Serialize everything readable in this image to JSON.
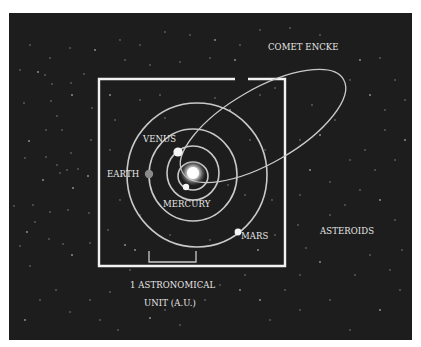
{
  "colors": {
    "page_bg": "#ffffff",
    "space_bg": "#1d1d1d",
    "orbit": "#c9c9c9",
    "box": "#f2f2f2",
    "label": "#e8e8e8",
    "star": "#9a9a9a",
    "earth": "#8a8a8a",
    "planet": "#f5f5f5"
  },
  "panel": {
    "x": 9,
    "y": 13,
    "w": 403,
    "h": 327
  },
  "scale_box": {
    "x": 99,
    "y": 79,
    "w": 186,
    "h": 187,
    "gap_x1": 235,
    "gap_x2": 248
  },
  "scale_bar": {
    "x1": 149,
    "x2": 196,
    "y_top": 251,
    "y_bottom": 262
  },
  "sun": {
    "cx": 193,
    "cy": 173,
    "core_r": 6,
    "glow_r": 13
  },
  "orbits": [
    {
      "name": "mercury-orbit",
      "cx": 193,
      "cy": 176,
      "rx": 15,
      "ry": 14
    },
    {
      "name": "venus-orbit",
      "cx": 193,
      "cy": 173,
      "rx": 26,
      "ry": 27
    },
    {
      "name": "earth-orbit",
      "cx": 193,
      "cy": 175,
      "rx": 44,
      "ry": 46
    },
    {
      "name": "mars-orbit",
      "cx": 197,
      "cy": 175,
      "rx": 70,
      "ry": 72
    }
  ],
  "comet_orbit": {
    "cx": 263,
    "cy": 126,
    "rx": 93,
    "ry": 37,
    "rotate": -30
  },
  "planets": [
    {
      "name": "mercury",
      "cx": 186,
      "cy": 187,
      "r": 3.2,
      "fill": "#f5f5f5"
    },
    {
      "name": "venus",
      "cx": 178,
      "cy": 152,
      "r": 4.6,
      "fill": "#f5f5f5"
    },
    {
      "name": "earth",
      "cx": 149,
      "cy": 174,
      "r": 4.2,
      "fill": "#8a8a8a"
    },
    {
      "name": "mars",
      "cx": 238,
      "cy": 232,
      "r": 3.4,
      "fill": "#f5f5f5"
    }
  ],
  "labels": {
    "comet": {
      "text": "COMET ENCKE",
      "x": 268,
      "y": 50
    },
    "venus": {
      "text": "VENUS",
      "x": 143,
      "y": 142
    },
    "earth": {
      "text": "EARTH",
      "x": 107,
      "y": 177
    },
    "mercury": {
      "text": "MERCURY",
      "x": 163,
      "y": 207
    },
    "mars": {
      "text": "MARS",
      "x": 241,
      "y": 239
    },
    "asteroids": {
      "text": "ASTEROIDS",
      "x": 320,
      "y": 234
    },
    "au_line1": {
      "text": "1 ASTRONOMICAL",
      "x": 130,
      "y": 288
    },
    "au_line2": {
      "text": "UNIT (A.U.)",
      "x": 144,
      "y": 306
    }
  },
  "stars": [
    [
      38,
      72
    ],
    [
      45,
      75
    ],
    [
      52,
      84
    ],
    [
      24,
      103
    ],
    [
      51,
      101
    ],
    [
      72,
      95
    ],
    [
      71,
      83
    ],
    [
      57,
      116
    ],
    [
      46,
      130
    ],
    [
      62,
      130
    ],
    [
      29,
      141
    ],
    [
      46,
      157
    ],
    [
      25,
      158
    ],
    [
      71,
      153
    ],
    [
      67,
      170
    ],
    [
      43,
      180
    ],
    [
      60,
      173
    ],
    [
      57,
      165
    ],
    [
      78,
      169
    ],
    [
      33,
      205
    ],
    [
      73,
      188
    ],
    [
      68,
      210
    ],
    [
      50,
      212
    ],
    [
      35,
      222
    ],
    [
      89,
      213
    ],
    [
      88,
      176
    ],
    [
      91,
      140
    ],
    [
      92,
      108
    ],
    [
      84,
      74
    ],
    [
      14,
      206
    ],
    [
      27,
      232
    ],
    [
      20,
      246
    ],
    [
      49,
      239
    ],
    [
      63,
      244
    ],
    [
      90,
      243
    ],
    [
      72,
      255
    ],
    [
      30,
      266
    ],
    [
      56,
      290
    ],
    [
      40,
      300
    ],
    [
      70,
      312
    ],
    [
      25,
      320
    ],
    [
      90,
      300
    ],
    [
      110,
      292
    ],
    [
      100,
      320
    ],
    [
      118,
      330
    ],
    [
      150,
      318
    ],
    [
      180,
      325
    ],
    [
      205,
      300
    ],
    [
      220,
      285
    ],
    [
      245,
      275
    ],
    [
      260,
      300
    ],
    [
      270,
      320
    ],
    [
      300,
      310
    ],
    [
      330,
      300
    ],
    [
      350,
      330
    ],
    [
      380,
      310
    ],
    [
      400,
      290
    ],
    [
      390,
      270
    ],
    [
      370,
      255
    ],
    [
      355,
      275
    ],
    [
      320,
      262
    ],
    [
      306,
      248
    ],
    [
      330,
      215
    ],
    [
      345,
      205
    ],
    [
      360,
      190
    ],
    [
      380,
      200
    ],
    [
      395,
      220
    ],
    [
      402,
      250
    ],
    [
      375,
      170
    ],
    [
      395,
      160
    ],
    [
      405,
      140
    ],
    [
      385,
      130
    ],
    [
      365,
      150
    ],
    [
      350,
      160
    ],
    [
      330,
      182
    ],
    [
      310,
      170
    ],
    [
      300,
      195
    ],
    [
      298,
      225
    ],
    [
      300,
      275
    ],
    [
      285,
      290
    ],
    [
      240,
      290
    ],
    [
      200,
      285
    ],
    [
      165,
      310
    ],
    [
      130,
      270
    ],
    [
      240,
      45
    ],
    [
      215,
      40
    ],
    [
      190,
      35
    ],
    [
      165,
      32
    ],
    [
      140,
      45
    ],
    [
      120,
      40
    ],
    [
      95,
      50
    ],
    [
      70,
      48
    ],
    [
      50,
      58
    ],
    [
      30,
      45
    ],
    [
      20,
      70
    ],
    [
      360,
      60
    ],
    [
      380,
      58
    ],
    [
      395,
      80
    ],
    [
      405,
      100
    ],
    [
      385,
      110
    ],
    [
      370,
      95
    ],
    [
      350,
      80
    ],
    [
      320,
      35
    ],
    [
      290,
      28
    ],
    [
      260,
      30
    ],
    [
      235,
      60
    ],
    [
      210,
      58
    ],
    [
      180,
      62
    ],
    [
      150,
      65
    ],
    [
      125,
      60
    ],
    [
      110,
      95
    ],
    [
      115,
      120
    ],
    [
      110,
      150
    ],
    [
      120,
      200
    ],
    [
      108,
      230
    ],
    [
      125,
      245
    ],
    [
      140,
      100
    ],
    [
      160,
      95
    ],
    [
      165,
      118
    ],
    [
      215,
      98
    ],
    [
      230,
      110
    ],
    [
      250,
      140
    ],
    [
      265,
      150
    ],
    [
      272,
      200
    ],
    [
      275,
      235
    ],
    [
      258,
      250
    ],
    [
      210,
      240
    ],
    [
      215,
      215
    ],
    [
      170,
      235
    ],
    [
      140,
      215
    ],
    [
      135,
      250
    ],
    [
      122,
      175
    ],
    [
      260,
      95
    ],
    [
      275,
      88
    ],
    [
      300,
      140
    ],
    [
      320,
      135
    ],
    [
      335,
      120
    ],
    [
      312,
      105
    ],
    [
      245,
      195
    ],
    [
      228,
      185
    ]
  ],
  "caption": "Solar system inner planets with Comet Encke orbit and 1 A.U. scale"
}
